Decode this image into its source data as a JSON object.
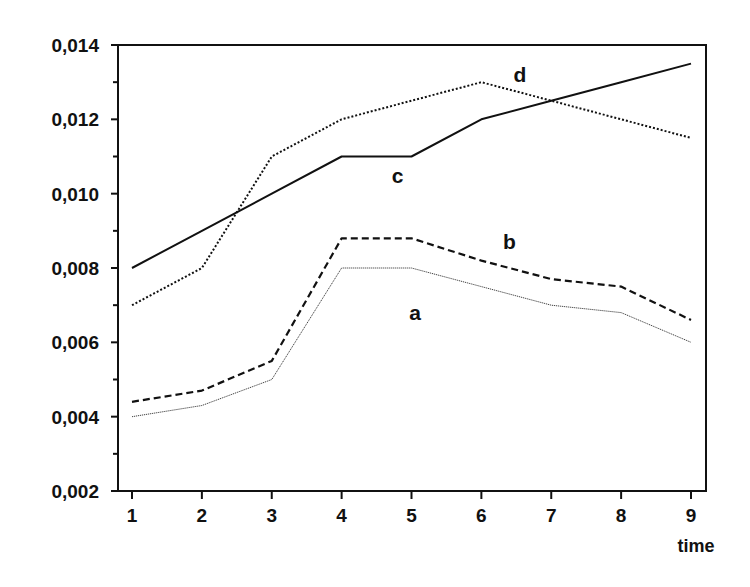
{
  "chart_data": {
    "type": "line",
    "title": "",
    "xlabel": "time",
    "ylabel": "",
    "x": [
      1,
      2,
      3,
      4,
      5,
      6,
      7,
      8,
      9
    ],
    "x_tick_labels": [
      "1",
      "2",
      "3",
      "4",
      "5",
      "6",
      "7",
      "8",
      "9"
    ],
    "y_tick_labels": [
      "0,002",
      "0,004",
      "0,006",
      "0,008",
      "0,010",
      "0,012",
      "0,014"
    ],
    "y_ticks": [
      0.002,
      0.004,
      0.006,
      0.008,
      0.01,
      0.012,
      0.014
    ],
    "y_minor_ticks": [
      0.003,
      0.005,
      0.007,
      0.009,
      0.011,
      0.013
    ],
    "ylim": [
      0.002,
      0.014
    ],
    "xlim": [
      0.8,
      9.2
    ],
    "grid": false,
    "legend": "inline labels",
    "series": [
      {
        "name": "a",
        "style": "thin-dotted",
        "values": [
          0.004,
          0.0043,
          0.005,
          0.008,
          0.008,
          0.0075,
          0.007,
          0.0068,
          0.006
        ],
        "label_pos": [
          5.05,
          0.0066
        ]
      },
      {
        "name": "b",
        "style": "dashed",
        "values": [
          0.0044,
          0.0047,
          0.0055,
          0.0088,
          0.0088,
          0.0082,
          0.0077,
          0.0075,
          0.0066
        ],
        "label_pos": [
          6.4,
          0.0085
        ]
      },
      {
        "name": "c",
        "style": "solid",
        "values": [
          0.008,
          0.009,
          0.01,
          0.011,
          0.011,
          0.012,
          0.0125,
          0.013,
          0.0135
        ],
        "label_pos": [
          4.8,
          0.0103
        ]
      },
      {
        "name": "d",
        "style": "dotted",
        "values": [
          0.007,
          0.008,
          0.011,
          0.012,
          0.0125,
          0.013,
          0.0125,
          0.012,
          0.0115
        ],
        "label_pos": [
          6.55,
          0.013
        ]
      }
    ]
  }
}
